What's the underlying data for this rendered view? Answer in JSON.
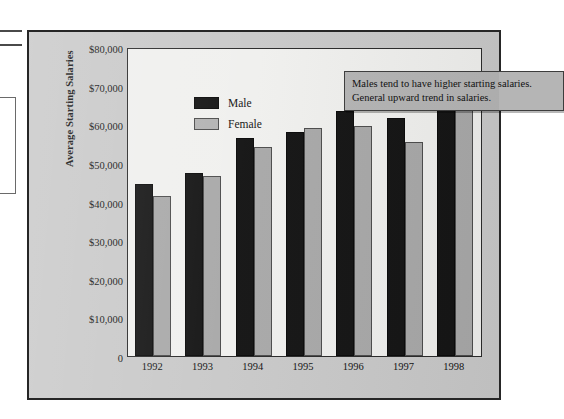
{
  "figure": {
    "background_color": "#c9c9c9",
    "plot_background_color": "#f0f0ee",
    "frame_color": "#262626"
  },
  "legend": {
    "position": "upper-left-inside",
    "entries": [
      {
        "label": "Male",
        "color": "#151515"
      },
      {
        "label": "Female",
        "color": "#a9a9a9"
      }
    ]
  },
  "annotation": {
    "line1": "Males tend to have higher starting salaries.",
    "line2": "General upward trend in salaries.",
    "background_color": "#b5b5b5",
    "border_color": "#3d3d3d"
  },
  "chart_data": {
    "type": "bar",
    "title": "",
    "xlabel": "",
    "ylabel": "Average Starting Salaries",
    "categories": [
      "1992",
      "1993",
      "1994",
      "1995",
      "1996",
      "1997",
      "1998"
    ],
    "series": [
      {
        "name": "Male",
        "color": "#151515",
        "values": [
          44500,
          47500,
          56500,
          58000,
          63500,
          61500,
          68000
        ]
      },
      {
        "name": "Female",
        "color": "#a9a9a9",
        "values": [
          41500,
          46500,
          54000,
          59000,
          59500,
          55500,
          65000
        ]
      }
    ],
    "ylim": [
      0,
      80000
    ],
    "ytick_values": [
      0,
      10000,
      20000,
      30000,
      40000,
      50000,
      60000,
      70000,
      80000
    ],
    "ytick_labels": [
      "0",
      "$10,000",
      "$20,000",
      "$30,000",
      "$40,000",
      "$50,000",
      "$60,000",
      "$70,000",
      "$80,000"
    ],
    "grid": false,
    "legend_position": "upper left"
  }
}
